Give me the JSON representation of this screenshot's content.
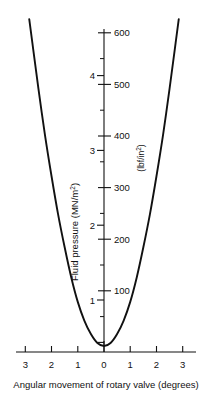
{
  "chart_data": {
    "type": "line",
    "title": "",
    "xlabel": "Angular movement of rotary valve (degrees)",
    "ylabel": "Fluid pressure (MN/m",
    "ylabel_sup": "2",
    "ylabel_prefix": "Fluid pressure (MN/m",
    "ylabel_suffix": ")",
    "y2label_prefix": "(lbf/in",
    "y2label_sup": "2",
    "y2label_suffix": ")",
    "xlim": [
      -3.45,
      3.45
    ],
    "ylim": [
      0,
      4.45
    ],
    "y2lim": [
      0,
      645
    ],
    "grid": false,
    "legend": null,
    "x_ticks": [
      -3,
      -2,
      -1,
      0,
      1,
      2,
      3
    ],
    "x_tick_labels": [
      "3",
      "2",
      "1",
      "0",
      "1",
      "2",
      "3"
    ],
    "y_ticks": [
      1,
      2,
      3,
      4
    ],
    "y_tick_labels": [
      "1",
      "2",
      "3",
      "4"
    ],
    "y2_ticks": [
      100,
      200,
      300,
      400,
      500,
      600
    ],
    "y2_tick_labels": [
      "100",
      "200",
      "300",
      "400",
      "500",
      "600"
    ],
    "y2_minor_ticks": [
      50,
      150,
      250,
      350,
      450,
      550
    ],
    "x": [
      -2.85,
      -2.7,
      -2.5,
      -2.25,
      -2.0,
      -1.75,
      -1.5,
      -1.25,
      -1.0,
      -0.75,
      -0.5,
      -0.25,
      0,
      0.25,
      0.5,
      0.75,
      1.0,
      1.25,
      1.5,
      1.75,
      2.0,
      2.25,
      2.5,
      2.7,
      2.85
    ],
    "y": [
      4.45,
      4.05,
      3.52,
      2.9,
      2.35,
      1.84,
      1.4,
      1.0,
      0.67,
      0.42,
      0.24,
      0.12,
      0.08,
      0.12,
      0.24,
      0.42,
      0.67,
      1.0,
      1.4,
      1.84,
      2.35,
      2.9,
      3.52,
      4.05,
      4.45
    ],
    "curve_note": "symmetric parabolic fluid-pressure curve, minimum at 0 degrees"
  },
  "axes": {
    "x_axis_name": "Angular movement of rotary valve (degrees)",
    "y_axis_name": "Fluid pressure (MN/m2)",
    "y2_axis_name": "(lbf/in2)"
  }
}
